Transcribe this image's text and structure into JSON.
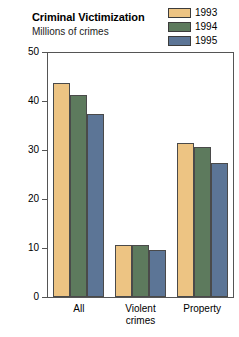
{
  "chart_data": {
    "type": "bar",
    "title": "Criminal Victimization",
    "subtitle": "Millions of crimes",
    "xlabel": "",
    "ylabel": "",
    "ylim": [
      0,
      50
    ],
    "yticks": [
      0,
      10,
      20,
      30,
      40,
      50
    ],
    "ytick_labels": [
      "0",
      "10",
      "20",
      "30",
      "40",
      "50"
    ],
    "grid": false,
    "legend_position": "top-right",
    "categories": [
      "All",
      "Violent crimes",
      "Property"
    ],
    "category_lines": [
      [
        "All"
      ],
      [
        "Violent",
        "crimes"
      ],
      [
        "Property"
      ]
    ],
    "series": [
      {
        "name": "1993",
        "color": "#edc483",
        "values": [
          43.6,
          10.7,
          31.4
        ]
      },
      {
        "name": "1994",
        "color": "#5d7a5d",
        "values": [
          41.3,
          10.6,
          30.6
        ]
      },
      {
        "name": "1995",
        "color": "#5c7596",
        "values": [
          37.4,
          9.6,
          27.3
        ]
      }
    ]
  },
  "legend": {
    "items": [
      {
        "label": "1993",
        "color": "#edc483"
      },
      {
        "label": "1994",
        "color": "#5d7a5d"
      },
      {
        "label": "1995",
        "color": "#5c7596"
      }
    ]
  },
  "axis": {
    "border_color": "#555555",
    "tick_color": "#555555"
  }
}
